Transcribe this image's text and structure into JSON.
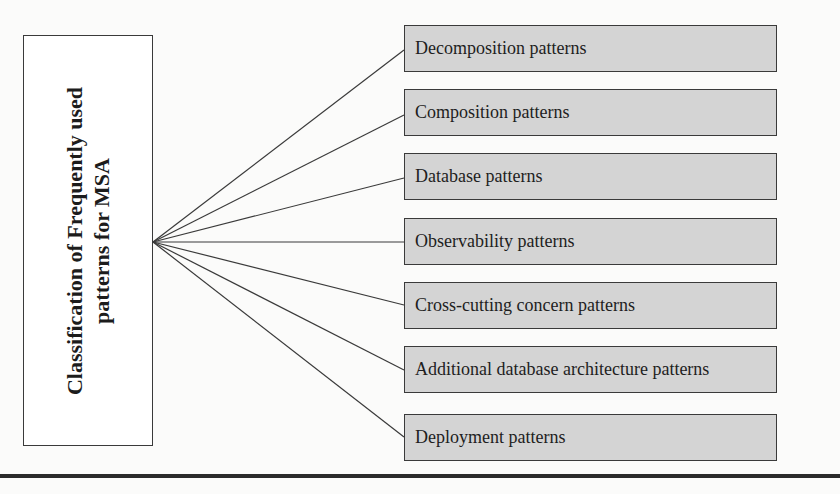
{
  "diagram": {
    "root": {
      "line1": "Classification of Frequently used",
      "line2": "patterns for MSA"
    },
    "leaves": [
      {
        "label": "Decomposition patterns",
        "top": 25
      },
      {
        "label": "Composition patterns",
        "top": 89
      },
      {
        "label": "Database patterns",
        "top": 153
      },
      {
        "label": "Observability patterns",
        "top": 218
      },
      {
        "label": "Cross-cutting concern patterns",
        "top": 282
      },
      {
        "label": "Additional database architecture patterns",
        "top": 346
      },
      {
        "label": "Deployment patterns",
        "top": 414
      }
    ],
    "colors": {
      "leaf_fill": "#d4d4d4",
      "root_fill": "#ffffff",
      "stroke": "#3a3a3a",
      "rule": "#2b2b2b"
    }
  }
}
